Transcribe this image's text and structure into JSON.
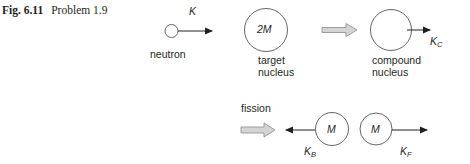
{
  "caption": {
    "figure_label": "Fig. 6.11",
    "title": "Problem 1.9"
  },
  "top_row": {
    "neutron": {
      "label": "neutron",
      "energy_symbol": "K"
    },
    "target": {
      "mass_label": "2M",
      "label_line1": "target",
      "label_line2": "nucleus"
    },
    "compound": {
      "label_line1": "compound",
      "label_line2": "nucleus",
      "energy_symbol": "K",
      "energy_subscript": "C"
    }
  },
  "bottom_row": {
    "process_label": "fission",
    "fragment_back": {
      "mass_label": "M",
      "energy_symbol": "K",
      "energy_subscript": "B"
    },
    "fragment_forward": {
      "mass_label": "M",
      "energy_symbol": "K",
      "energy_subscript": "F"
    }
  },
  "colors": {
    "line": "#231f20",
    "hollow_arrow_fill": "#d4d4d4",
    "hollow_arrow_stroke": "#8a8a8a"
  }
}
